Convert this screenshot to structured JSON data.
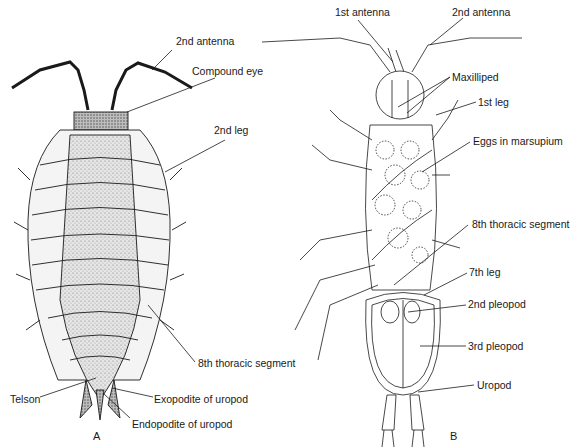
{
  "figure": {
    "panels": [
      {
        "id": "A",
        "label": "A",
        "view": "dorsal"
      },
      {
        "id": "B",
        "label": "B",
        "view": "ventral"
      }
    ]
  },
  "labels_a": {
    "antenna2": "2nd antenna",
    "compound_eye": "Compound eye",
    "leg2": "2nd leg",
    "thoracic8": "8th thoracic segment",
    "telson": "Telson",
    "exopodite": "Exopodite of uropod",
    "endopodite": "Endopodite of uropod"
  },
  "labels_b": {
    "antenna1": "1st antenna",
    "antenna2": "2nd antenna",
    "maxilliped": "Maxilliped",
    "leg1": "1st leg",
    "eggs": "Eggs in marsupium",
    "thoracic8": "8th thoracic segment",
    "leg7": "7th leg",
    "pleopod2": "2nd pleopod",
    "pleopod3": "3rd pleopod",
    "uropod": "Uropod"
  },
  "colors": {
    "ink": "#1a1a1a",
    "stipple": "#9a9a9a",
    "dark_stipple": "#5a5a5a",
    "paper": "#ffffff"
  }
}
